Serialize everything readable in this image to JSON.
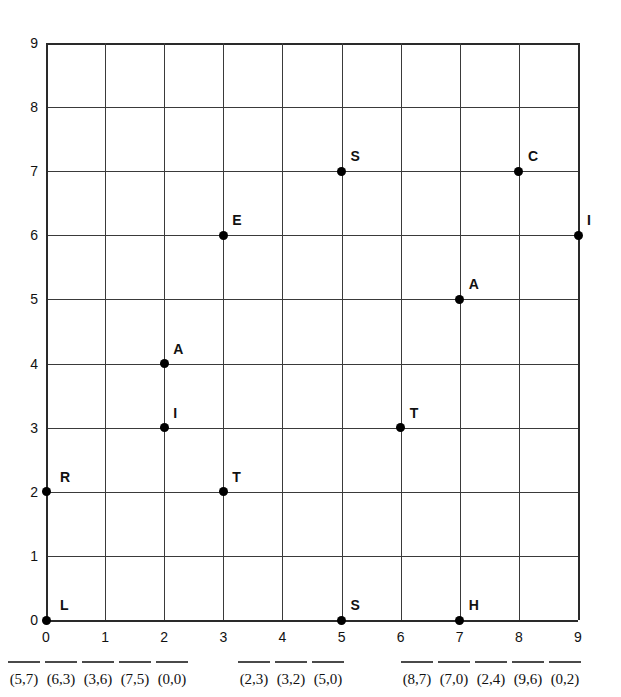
{
  "chart_data": {
    "type": "scatter",
    "title": "",
    "xlabel": "",
    "ylabel": "",
    "xlim": [
      0,
      9
    ],
    "ylim": [
      0,
      9
    ],
    "grid": true,
    "legend": "none",
    "x_ticks": [
      "0",
      "1",
      "2",
      "3",
      "4",
      "5",
      "6",
      "7",
      "8",
      "9"
    ],
    "y_ticks": [
      "0",
      "1",
      "2",
      "3",
      "4",
      "5",
      "6",
      "7",
      "8",
      "9"
    ],
    "points": [
      {
        "label": "L",
        "x": 0,
        "y": 0,
        "label_dx": 14,
        "label_dy": -22
      },
      {
        "label": "R",
        "x": 0,
        "y": 2,
        "label_dx": 14,
        "label_dy": -22
      },
      {
        "label": "I",
        "x": 2,
        "y": 3,
        "label_dx": 9,
        "label_dy": -22
      },
      {
        "label": "A",
        "x": 2,
        "y": 4,
        "label_dx": 9,
        "label_dy": -22
      },
      {
        "label": "T",
        "x": 3,
        "y": 2,
        "label_dx": 9,
        "label_dy": -22
      },
      {
        "label": "E",
        "x": 3,
        "y": 6,
        "label_dx": 9,
        "label_dy": -22
      },
      {
        "label": "S",
        "x": 5,
        "y": 0,
        "label_dx": 9,
        "label_dy": -22
      },
      {
        "label": "S",
        "x": 5,
        "y": 7,
        "label_dx": 9,
        "label_dy": -22
      },
      {
        "label": "T",
        "x": 6,
        "y": 3,
        "label_dx": 9,
        "label_dy": -22
      },
      {
        "label": "H",
        "x": 7,
        "y": 0,
        "label_dx": 9,
        "label_dy": -22
      },
      {
        "label": "A",
        "x": 7,
        "y": 5,
        "label_dx": 9,
        "label_dy": -22
      },
      {
        "label": "C",
        "x": 8,
        "y": 7,
        "label_dx": 9,
        "label_dy": -22
      },
      {
        "label": "I",
        "x": 9,
        "y": 6,
        "label_dx": 9,
        "label_dy": -22
      }
    ]
  },
  "answers": {
    "groups": [
      {
        "left_px": 8,
        "blanks": [
          {
            "coord": "(5,7)"
          },
          {
            "coord": "(6,3)"
          },
          {
            "coord": "(3,6)"
          },
          {
            "coord": "(7,5)"
          },
          {
            "coord": "(0,0)"
          }
        ]
      },
      {
        "left_px": 238,
        "blanks": [
          {
            "coord": "(2,3)"
          },
          {
            "coord": "(3,2)"
          },
          {
            "coord": "(5,0)"
          }
        ]
      },
      {
        "left_px": 401,
        "blanks": [
          {
            "coord": "(8,7)"
          },
          {
            "coord": "(7,0)"
          },
          {
            "coord": "(2,4)"
          },
          {
            "coord": "(9,6)"
          },
          {
            "coord": "(0,2)"
          }
        ]
      }
    ]
  },
  "style": {
    "grid_color": "#3a3a3a",
    "border_color": "#2a2a2a",
    "point_color": "#000000",
    "text_color": "#111111",
    "background": "#ffffff"
  }
}
